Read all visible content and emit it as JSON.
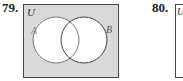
{
  "problems": [
    {
      "number": "79.",
      "universe_label": "U",
      "set_a_label": "A",
      "set_b_label": "B",
      "shaded_region": "complement of A union B (outside both circles)",
      "colors": {
        "shade": "#d9d9d9",
        "circle_fill": "#ffffff",
        "stroke": "#555555"
      }
    },
    {
      "number": "80.",
      "universe_label": "U"
    }
  ]
}
